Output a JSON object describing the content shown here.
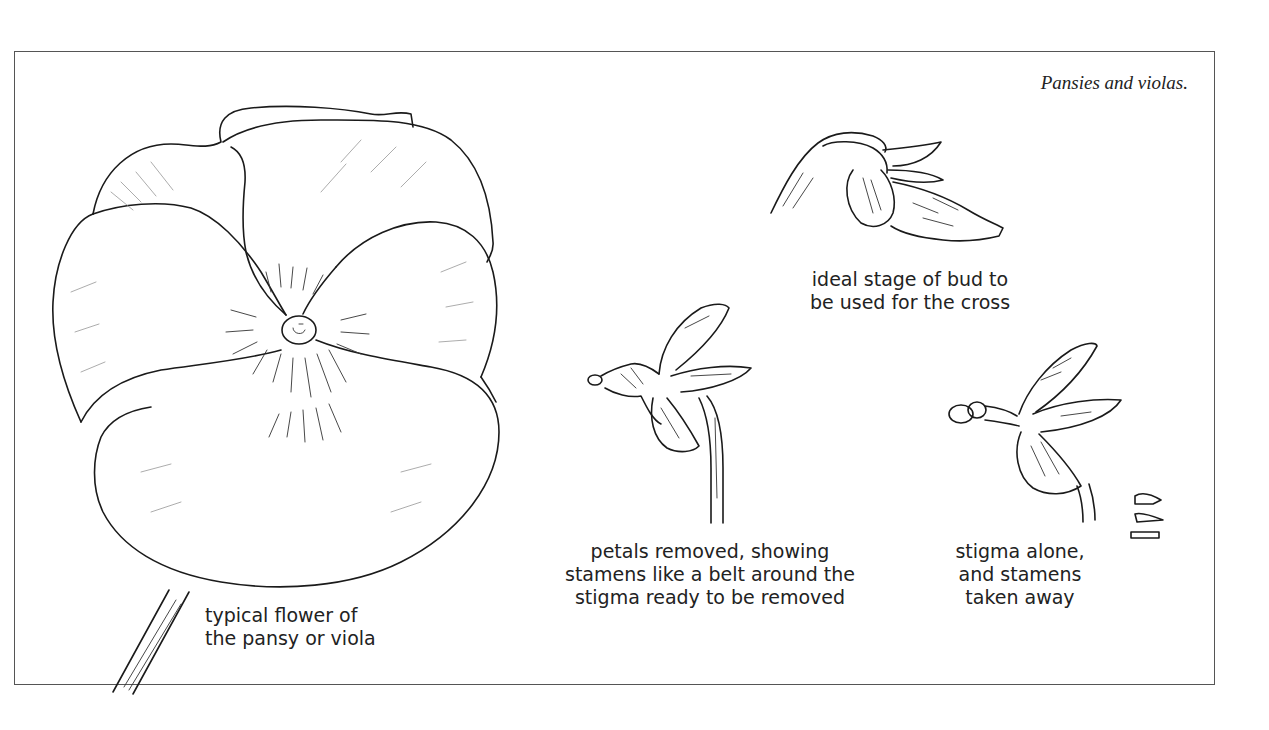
{
  "figure": {
    "title": "Pansies and violas.",
    "background_color": "#ffffff",
    "line_color": "#1a1a1a",
    "frame_color": "#555555"
  },
  "illustrations": [
    {
      "id": "pansy-flower",
      "caption_lines": [
        "typical flower of",
        "the pansy or viola"
      ]
    },
    {
      "id": "bud",
      "caption_lines": [
        "ideal stage of bud to",
        "be used for the cross"
      ]
    },
    {
      "id": "petals-removed",
      "caption_lines": [
        "petals removed, showing",
        "stamens like a belt around the",
        "stigma ready to be removed"
      ]
    },
    {
      "id": "stigma-alone",
      "caption_lines": [
        "stigma alone,",
        "and stamens",
        "taken away"
      ]
    }
  ]
}
